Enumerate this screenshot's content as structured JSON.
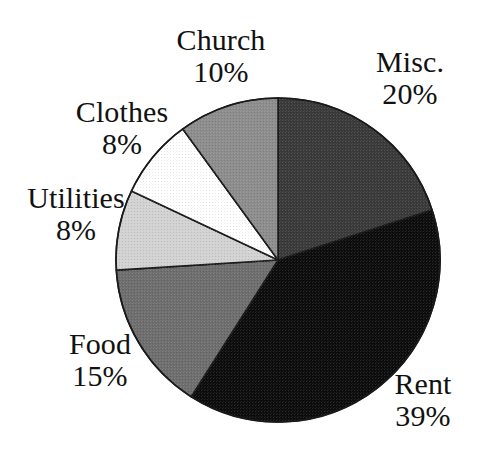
{
  "chart_data": {
    "type": "pie",
    "title": "",
    "subtitle": "",
    "xlabel": "",
    "ylabel": "",
    "legend_position": "none",
    "grid": false,
    "units": "percent",
    "total": 100,
    "start_angle_deg": 0,
    "direction": "clockwise",
    "categories": [
      "Misc.",
      "Rent",
      "Food",
      "Utilities",
      "Clothes",
      "Church"
    ],
    "values": [
      20,
      39,
      15,
      8,
      8,
      10
    ],
    "slices": [
      {
        "label": "Misc.",
        "value": 20,
        "value_text": "20%",
        "color": "#3a3a3a",
        "start_deg": 0,
        "end_deg": 72
      },
      {
        "label": "Rent",
        "value": 39,
        "value_text": "39%",
        "color": "#0d0d0d",
        "start_deg": 72,
        "end_deg": 212.4
      },
      {
        "label": "Food",
        "value": 15,
        "value_text": "15%",
        "color": "#6e6e6e",
        "start_deg": 212.4,
        "end_deg": 266.4
      },
      {
        "label": "Utilities",
        "value": 8,
        "value_text": "8%",
        "color": "#d2d2d2",
        "start_deg": 266.4,
        "end_deg": 295.2
      },
      {
        "label": "Clothes",
        "value": 8,
        "value_text": "8%",
        "color": "#ffffff",
        "start_deg": 295.2,
        "end_deg": 324
      },
      {
        "label": "Church",
        "value": 10,
        "value_text": "10%",
        "color": "#8d8d8d",
        "start_deg": 324,
        "end_deg": 360
      }
    ]
  },
  "labels": {
    "church": {
      "name": "Church",
      "value": "10%"
    },
    "misc": {
      "name": "Misc.",
      "value": "20%"
    },
    "clothes": {
      "name": "Clothes",
      "value": "8%"
    },
    "utilities": {
      "name": "Utilities",
      "value": "8%"
    },
    "food": {
      "name": "Food",
      "value": "15%"
    },
    "rent": {
      "name": "Rent",
      "value": "39%"
    }
  },
  "geometry": {
    "center_x": 278,
    "center_y": 260,
    "radius": 162,
    "stroke_color": "#1a1a1a",
    "stroke_width": 1.6,
    "background": "#ffffff"
  }
}
